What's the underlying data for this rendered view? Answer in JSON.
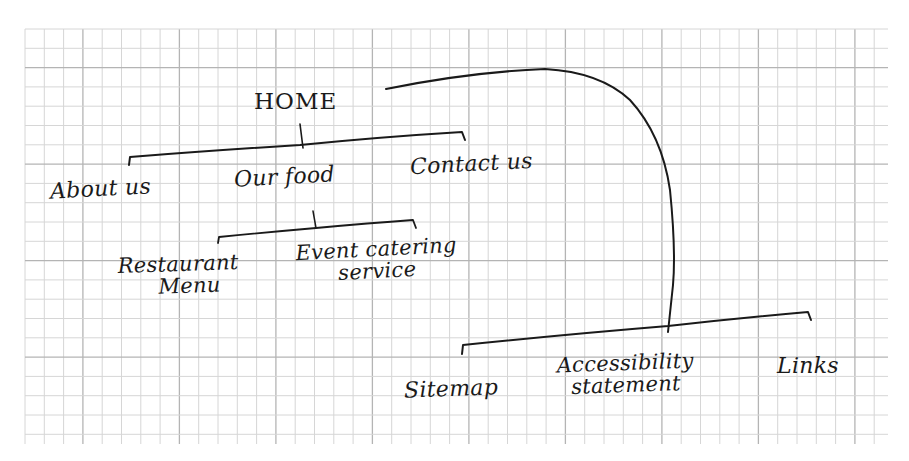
{
  "diagram": {
    "type": "hand-drawn sitemap on graph paper",
    "colors": {
      "paper": "#ffffff",
      "grid_minor": "#d6d6d6",
      "grid_major": "#b4b4b4",
      "ink": "#1a1a1a"
    },
    "grid": {
      "left": 25,
      "top": 29,
      "right": 888,
      "bottom": 444,
      "spacing": 19.3,
      "major_every": 5
    },
    "nodes": {
      "home": {
        "label": "HOME"
      },
      "about_us": {
        "label": "About us"
      },
      "our_food": {
        "label": "Our food"
      },
      "contact_us": {
        "label": "Contact us"
      },
      "restaurant_menu": {
        "line1": "Restaurant",
        "line2": "Menu"
      },
      "event_catering": {
        "line1": "Event catering",
        "line2": "service"
      },
      "sitemap": {
        "label": "Sitemap"
      },
      "accessibility": {
        "line1": "Accessibility",
        "line2": "statement"
      },
      "links": {
        "label": "Links"
      }
    },
    "edges": [
      {
        "from": "HOME",
        "to": [
          "About us",
          "Our food",
          "Contact us"
        ]
      },
      {
        "from": "Our food",
        "to": [
          "Restaurant Menu",
          "Event catering service"
        ]
      },
      {
        "from": "HOME",
        "to": [
          "Sitemap",
          "Accessibility statement",
          "Links"
        ]
      }
    ]
  }
}
